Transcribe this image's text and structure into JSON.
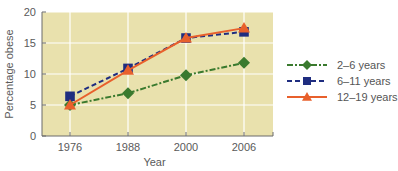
{
  "chart_data": {
    "type": "line",
    "title": "",
    "xlabel": "Year",
    "ylabel": "Percentage obese",
    "x": [
      "1976",
      "1988",
      "2000",
      "2006"
    ],
    "ylim": [
      0,
      20
    ],
    "yticks": [
      0,
      5,
      10,
      15,
      20
    ],
    "grid": true,
    "legend_position": "right",
    "series": [
      {
        "name": "2–6 years",
        "values": [
          5.0,
          6.9,
          9.8,
          11.8
        ],
        "color": "#3a7a2e",
        "marker": "diamond",
        "dash": "dash-dot"
      },
      {
        "name": "6–11 years",
        "values": [
          6.4,
          10.9,
          15.8,
          16.8
        ],
        "color": "#1f2d80",
        "marker": "square",
        "dash": "dashed"
      },
      {
        "name": "12–19 years",
        "values": [
          5.0,
          10.6,
          15.8,
          17.4
        ],
        "color": "#e8602c",
        "marker": "triangle",
        "dash": "solid"
      }
    ]
  },
  "colors": {
    "plot_background": "#e9e1ad",
    "gridline": "#ffffff",
    "axis": "#6b6b6b"
  }
}
